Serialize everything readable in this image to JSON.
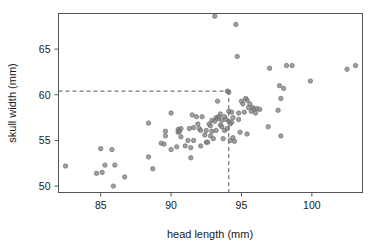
{
  "chart_data": {
    "type": "scatter",
    "title": "",
    "xlabel": "head length (mm)",
    "ylabel": "skull width (mm)",
    "xlim": [
      82.0,
      103.6
    ],
    "ylim": [
      49.3,
      68.9
    ],
    "xticks": [
      85,
      90,
      95,
      100
    ],
    "yticks": [
      50,
      55,
      60,
      65
    ],
    "xtick_labels": [
      "85",
      "90",
      "95",
      "100"
    ],
    "ytick_labels": [
      "50",
      "55",
      "60",
      "65"
    ],
    "grid": false,
    "legend": null,
    "point_color": "#808080",
    "point_edge_color": "#6e6e6e",
    "point_radius": 2.2,
    "frame_color": "#555555",
    "annotations": [
      {
        "name": "reference-lines",
        "style": "dashed",
        "color": "#555555",
        "x": 94.1,
        "y": 60.4,
        "description": "dashed crosshair from axes to highlighted point"
      }
    ],
    "x": [
      82.5,
      84.7,
      85.0,
      85.1,
      85.3,
      85.8,
      85.9,
      86.0,
      86.7,
      88.4,
      88.4,
      88.7,
      89.3,
      89.5,
      89.6,
      89.6,
      90.0,
      90.0,
      90.4,
      90.5,
      90.5,
      90.6,
      90.7,
      90.7,
      91.0,
      91.2,
      91.3,
      91.4,
      91.4,
      91.5,
      91.6,
      91.6,
      91.8,
      91.9,
      92.0,
      92.1,
      92.1,
      92.2,
      92.4,
      92.5,
      92.5,
      92.6,
      92.7,
      92.8,
      92.8,
      92.9,
      92.9,
      93.0,
      93.1,
      93.1,
      93.2,
      93.2,
      93.3,
      93.3,
      93.4,
      93.5,
      93.5,
      93.6,
      93.6,
      93.7,
      93.8,
      93.8,
      93.9,
      94.0,
      94.0,
      94.1,
      94.1,
      94.1,
      94.2,
      94.2,
      94.3,
      94.3,
      94.4,
      94.4,
      94.5,
      94.6,
      94.7,
      94.8,
      94.8,
      94.9,
      95.0,
      95.1,
      95.2,
      95.3,
      95.4,
      95.4,
      95.5,
      95.6,
      95.7,
      95.8,
      95.9,
      96.0,
      96.1,
      96.3,
      96.9,
      97.0,
      97.6,
      97.7,
      97.8,
      97.8,
      98.0,
      98.2,
      98.6,
      99.9,
      102.5,
      103.1
    ],
    "y": [
      52.2,
      51.4,
      54.1,
      51.5,
      52.3,
      54.0,
      50.0,
      52.3,
      51.0,
      53.2,
      56.9,
      51.9,
      54.7,
      54.6,
      56.0,
      55.5,
      54.0,
      58.0,
      54.3,
      56.2,
      55.9,
      56.0,
      56.3,
      55.4,
      54.4,
      55.0,
      56.3,
      53.1,
      54.2,
      57.8,
      56.4,
      55.0,
      57.6,
      56.8,
      56.3,
      54.4,
      56.1,
      57.6,
      55.6,
      56.1,
      54.8,
      54.8,
      56.8,
      55.5,
      56.6,
      57.2,
      56.0,
      55.2,
      68.6,
      57.1,
      57.5,
      56.1,
      59.3,
      57.4,
      57.6,
      56.7,
      57.9,
      57.2,
      56.5,
      55.2,
      57.6,
      56.1,
      57.3,
      60.4,
      56.3,
      60.3,
      58.2,
      57.1,
      55.0,
      56.8,
      58.1,
      57.0,
      55.3,
      57.5,
      54.9,
      67.7,
      64.2,
      57.3,
      58.0,
      55.9,
      59.3,
      59.0,
      58.1,
      59.6,
      55.7,
      59.4,
      58.6,
      59.0,
      58.2,
      58.6,
      58.4,
      58.0,
      58.5,
      58.4,
      56.5,
      62.9,
      58.3,
      61.0,
      59.6,
      55.5,
      60.7,
      63.2,
      63.2,
      61.5,
      62.8,
      63.2
    ]
  },
  "labels": {
    "x_axis_title": "head length (mm)",
    "y_axis_title": "skull width (mm)"
  }
}
